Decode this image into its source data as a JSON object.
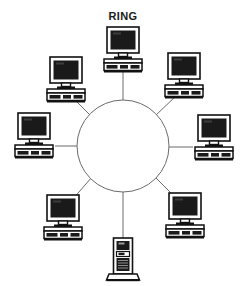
{
  "diagram": {
    "title": "RING",
    "type": "network-topology",
    "topology_label": "RING",
    "background_color": "#ffffff",
    "line_color": "#6b6b6b",
    "ink_color": "#111111",
    "screen_color": "#1a1a1a",
    "case_color": "#ffffff",
    "hub": {
      "name": "ring-backbone",
      "shape": "circle",
      "cx": 123,
      "cy": 146,
      "r": 46,
      "stroke": "#6b6b6b",
      "fill": "#ffffff"
    },
    "nodes": [
      {
        "id": "node-top",
        "label": "",
        "device": "desktop-computer",
        "x": 123,
        "y": 48,
        "link_from": {
          "x": 123,
          "y": 70
        },
        "link_to": {
          "x": 123,
          "y": 100
        }
      },
      {
        "id": "node-upper-left",
        "label": "",
        "device": "desktop-computer",
        "x": 66,
        "y": 78,
        "link_from": {
          "x": 74,
          "y": 99
        },
        "link_to": {
          "x": 92,
          "y": 117
        }
      },
      {
        "id": "node-upper-right",
        "label": "",
        "device": "desktop-computer",
        "x": 184,
        "y": 74,
        "link_from": {
          "x": 176,
          "y": 96
        },
        "link_to": {
          "x": 155,
          "y": 116
        }
      },
      {
        "id": "node-left",
        "label": "",
        "device": "desktop-computer",
        "x": 34,
        "y": 134,
        "link_from": {
          "x": 55,
          "y": 146
        },
        "link_to": {
          "x": 77,
          "y": 146
        }
      },
      {
        "id": "node-right",
        "label": "",
        "device": "desktop-computer",
        "x": 214,
        "y": 136,
        "link_from": {
          "x": 193,
          "y": 147
        },
        "link_to": {
          "x": 169,
          "y": 147
        }
      },
      {
        "id": "node-lower-left",
        "label": "",
        "device": "desktop-computer",
        "x": 63,
        "y": 216,
        "link_from": {
          "x": 72,
          "y": 200
        },
        "link_to": {
          "x": 92,
          "y": 177
        }
      },
      {
        "id": "node-lower-right",
        "label": "",
        "device": "desktop-computer",
        "x": 185,
        "y": 214,
        "link_from": {
          "x": 176,
          "y": 198
        },
        "link_to": {
          "x": 155,
          "y": 177
        }
      },
      {
        "id": "node-bottom-server",
        "label": "",
        "device": "tower-server",
        "x": 123,
        "y": 258,
        "link_from": {
          "x": 123,
          "y": 238
        },
        "link_to": {
          "x": 123,
          "y": 192
        }
      }
    ],
    "node_count": 8,
    "computer_count": 7,
    "server_count": 1
  }
}
